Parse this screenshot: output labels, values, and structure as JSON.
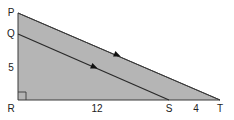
{
  "diagram": {
    "type": "geometry-triangle",
    "colors": {
      "fill": "#b5b5b5",
      "stroke": "#3a3a3a",
      "text": "#222222",
      "background": "#ffffff"
    },
    "points": {
      "P": {
        "label": "P",
        "x": 18,
        "y": 13
      },
      "Q": {
        "label": "Q",
        "x": 18,
        "y": 34
      },
      "R": {
        "label": "R",
        "x": 18,
        "y": 100
      },
      "S": {
        "label": "S",
        "x": 169,
        "y": 100
      },
      "T": {
        "label": "T",
        "x": 220,
        "y": 100
      }
    },
    "measurements": {
      "QR": "5",
      "RS": "12",
      "ST": "4"
    },
    "right_angle_at": "R",
    "parallel_segments": [
      "PT",
      "QS"
    ]
  }
}
